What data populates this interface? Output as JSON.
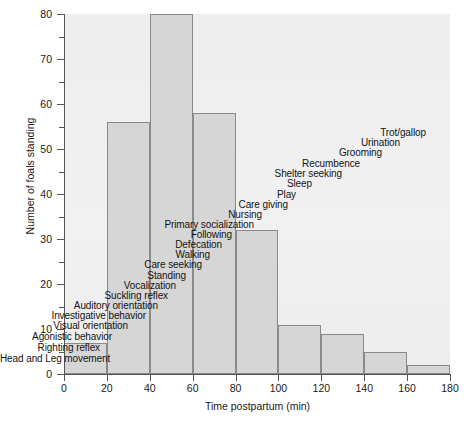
{
  "chart_data": {
    "type": "bar",
    "title": "",
    "subtitle": "",
    "xlabel": "Time postpartum (min)",
    "ylabel": "Number of foals standing",
    "xlim": [
      0,
      180
    ],
    "ylim": [
      0,
      80
    ],
    "bin_width": 20,
    "grid": false,
    "legend": "none",
    "categories": [
      "0-20",
      "20-40",
      "40-60",
      "60-80",
      "80-100",
      "100-120",
      "120-140",
      "140-160",
      "160-180"
    ],
    "bin_starts": [
      0,
      20,
      40,
      60,
      80,
      100,
      120,
      140,
      160
    ],
    "values": [
      7,
      56,
      80,
      58,
      32,
      11,
      9,
      5,
      2
    ],
    "x_ticks": [
      0,
      20,
      40,
      60,
      80,
      100,
      120,
      140,
      160,
      180
    ],
    "y_ticks_major": [
      0,
      10,
      20,
      30,
      40,
      50,
      60,
      70,
      80
    ],
    "y_ticks_minor": [
      5,
      15,
      25,
      35,
      45,
      55,
      65,
      75
    ],
    "annotations": [
      {
        "text": "Head and Leg movement",
        "x": 108,
        "y": 363
      },
      {
        "text": "Righting reflex",
        "x": 100,
        "y": 352
      },
      {
        "text": "Agonistic behavior",
        "x": 112,
        "y": 341
      },
      {
        "text": "Visual orientation",
        "x": 128,
        "y": 330
      },
      {
        "text": "Investigative behavior",
        "x": 146,
        "y": 320
      },
      {
        "text": "Auditory orientation",
        "x": 158,
        "y": 310
      },
      {
        "text": "Suckling reflex",
        "x": 168,
        "y": 300
      },
      {
        "text": "Vocalization",
        "x": 176,
        "y": 290
      },
      {
        "text": "Standing",
        "x": 186,
        "y": 280
      },
      {
        "text": "Care seeking",
        "x": 202,
        "y": 269
      },
      {
        "text": "Walking",
        "x": 210,
        "y": 259
      },
      {
        "text": "Defecation",
        "x": 222,
        "y": 249
      },
      {
        "text": "Following",
        "x": 232,
        "y": 239
      },
      {
        "text": "Primary socialization",
        "x": 254,
        "y": 229
      },
      {
        "text": "Nursing",
        "x": 262,
        "y": 219
      },
      {
        "text": "Care giving",
        "x": 288,
        "y": 209
      },
      {
        "text": "Play",
        "x": 296,
        "y": 199
      },
      {
        "text": "Sleep",
        "x": 312,
        "y": 188
      },
      {
        "text": "Shelter seeking",
        "x": 342,
        "y": 178
      },
      {
        "text": "Recumbence",
        "x": 360,
        "y": 168
      },
      {
        "text": "Grooming",
        "x": 382,
        "y": 157
      },
      {
        "text": "Urination",
        "x": 400,
        "y": 147
      },
      {
        "text": "Trot/gallop",
        "x": 426,
        "y": 137
      }
    ],
    "colors": {
      "bar_fill": "#d6d6d6",
      "bar_stroke": "#8a8a8a",
      "panel_background": "#efefef",
      "axis": "#555555",
      "text": "#1a1a1a"
    }
  }
}
